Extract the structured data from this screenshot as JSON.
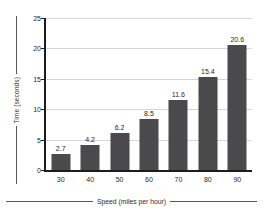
{
  "chart_data": {
    "type": "bar",
    "title": "",
    "categories": [
      "30",
      "40",
      "50",
      "60",
      "70",
      "80",
      "90"
    ],
    "values": [
      2.7,
      4.2,
      6.2,
      8.5,
      11.6,
      15.4,
      20.6
    ],
    "data_labels": [
      "2.7",
      "4.2",
      "6.2",
      "8.5",
      "11.6",
      "15.4",
      "20.6"
    ],
    "xlabel": "Speed (miles per hour)",
    "ylabel": "Time (seconds)",
    "xtick_labels": [
      "30",
      "40",
      "50",
      "60",
      "70",
      "80",
      "90"
    ],
    "ytick_labels": [
      "0",
      "5",
      "10",
      "15",
      "20",
      "25"
    ],
    "ytick_values": [
      0,
      5,
      10,
      15,
      20,
      25
    ],
    "ylim": [
      0,
      25
    ],
    "grid": "horizontal",
    "legend": "none",
    "bar_color": "#4a4a4c",
    "gridline_color": "#d6d6d8",
    "axis_color": "#1c1c1e",
    "text_color": "#1f1f21",
    "background": "#ffffff"
  }
}
